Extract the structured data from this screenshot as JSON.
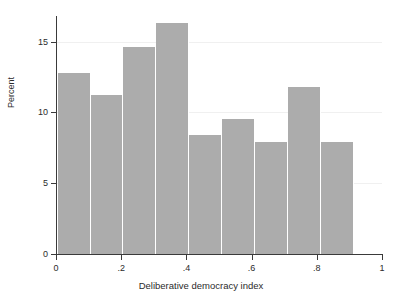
{
  "chart_data": {
    "type": "bar",
    "title": "",
    "subtitle": "",
    "xlabel": "Deliberative democracy index",
    "ylabel": "Percent",
    "xlim": [
      0,
      1
    ],
    "ylim": [
      0,
      16.8
    ],
    "grid": true,
    "legend": null,
    "bin_width": 0.101,
    "bin_edges": [
      0.005,
      0.106,
      0.207,
      0.308,
      0.409,
      0.51,
      0.611,
      0.712,
      0.813,
      0.914
    ],
    "categories": [
      "0.005–0.106",
      "0.106–0.207",
      "0.207–0.308",
      "0.308–0.409",
      "0.409–0.510",
      "0.510–0.611",
      "0.611–0.712",
      "0.712–0.813",
      "0.813–0.914"
    ],
    "values": [
      12.8,
      11.2,
      14.6,
      16.3,
      8.4,
      9.5,
      7.9,
      11.8,
      7.9
    ],
    "bar_color": "#acacac",
    "xticks": [
      {
        "value": 0,
        "label": "0"
      },
      {
        "value": 0.2,
        "label": ".2"
      },
      {
        "value": 0.4,
        "label": ".4"
      },
      {
        "value": 0.6,
        "label": ".6"
      },
      {
        "value": 0.8,
        "label": ".8"
      },
      {
        "value": 1,
        "label": "1"
      }
    ],
    "yticks": [
      {
        "value": 0,
        "label": "0"
      },
      {
        "value": 5,
        "label": "5"
      },
      {
        "value": 10,
        "label": "10"
      },
      {
        "value": 15,
        "label": "15"
      }
    ]
  }
}
